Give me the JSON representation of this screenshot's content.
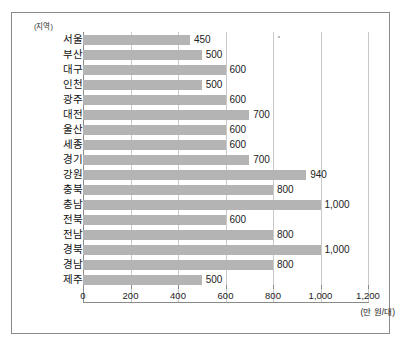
{
  "page": {
    "cropped_top_text": "· · · · · · · · · · ·"
  },
  "chart_data": {
    "type": "bar",
    "orientation": "horizontal",
    "title": "",
    "xlabel": "(만 원/대)",
    "ylabel": "(지역)",
    "categories": [
      "서울",
      "부산",
      "대구",
      "인천",
      "광주",
      "대전",
      "울산",
      "세종",
      "경기",
      "강원",
      "충북",
      "충남",
      "전북",
      "전남",
      "경북",
      "경남",
      "제주"
    ],
    "values": [
      450,
      500,
      600,
      500,
      600,
      700,
      600,
      600,
      700,
      940,
      800,
      1000,
      600,
      800,
      1000,
      800,
      500
    ],
    "value_labels": [
      "450",
      "500",
      "600",
      "500",
      "600",
      "700",
      "600",
      "600",
      "700",
      "940",
      "800",
      "1,000",
      "600",
      "800",
      "1,000",
      "800",
      "500"
    ],
    "xlim": [
      0,
      1200
    ],
    "xticks": [
      0,
      200,
      400,
      600,
      800,
      1000,
      1200
    ],
    "xtick_labels": [
      "0",
      "200",
      "400",
      "600",
      "800",
      "1,000",
      "1,200"
    ],
    "grid": true,
    "legend": "none",
    "bar_color": "#b4b4b4",
    "gridline_color": "#c9c9c9",
    "axis_color": "#8a8a8a"
  }
}
